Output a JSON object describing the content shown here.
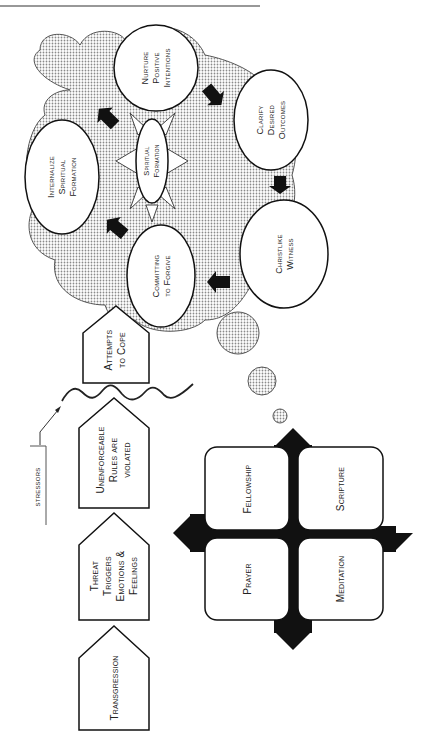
{
  "diagram": {
    "flow": {
      "transgression": [
        "Transgression"
      ],
      "threat": [
        "Threat",
        "Triggers",
        "Emotions &",
        "Feelings"
      ],
      "unenforceable": [
        "Unenforceable",
        "Rules are",
        "violated"
      ],
      "attempts": [
        "Attempts",
        "to Cope"
      ],
      "stressors": "stressors"
    },
    "cloud": {
      "center": [
        "Spiritual",
        "Formation"
      ],
      "nurture": [
        "Nurture",
        "Positive",
        "Intentions"
      ],
      "clarify": [
        "Clarify",
        "Desired",
        "Outcomes"
      ],
      "christlike": [
        "Christlike",
        "Witness"
      ],
      "forgive": [
        "Committing",
        "to Forgive"
      ],
      "internalize": [
        "Internalize",
        "Spiritual",
        "Formation"
      ]
    },
    "disciplines": {
      "fellowship": "Fellowship",
      "scripture": "Scripture",
      "prayer": "Prayer",
      "meditation": "Meditation"
    },
    "colors": {
      "stroke": "#111111",
      "fill": "#ffffff",
      "dots": "#9a9a9a",
      "arrow": "#111111"
    }
  }
}
